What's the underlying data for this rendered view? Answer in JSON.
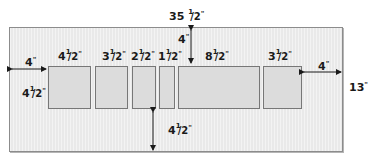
{
  "diagram": {
    "overall_width_label": "35",
    "overall_width_frac": "1/2",
    "overall_height_label": "13",
    "unit_mark": "\"",
    "top_margin": "4",
    "bottom_margin_whole": "4",
    "bottom_margin_frac": "1/2",
    "left_margin": "4",
    "right_margin": "4",
    "panel_height_whole": "4",
    "panel_height_frac": "1/2",
    "panels": [
      {
        "whole": "4",
        "frac": "1/2",
        "width_in": 4.5
      },
      {
        "whole": "3",
        "frac": "1/2",
        "width_in": 3.5
      },
      {
        "whole": "2",
        "frac": "1/2",
        "width_in": 2.5
      },
      {
        "whole": "1",
        "frac": "1/2",
        "width_in": 1.5
      },
      {
        "whole": "8",
        "frac": "1/2",
        "width_in": 8.5
      },
      {
        "whole": "3",
        "frac": "1/2",
        "width_in": 3.5
      }
    ],
    "colors": {
      "background": "#efefef",
      "panel_fill": "#dcdcdc",
      "panel_border": "#777777",
      "frame_border": "#8c8c8c",
      "text": "#1a1a1a"
    }
  }
}
